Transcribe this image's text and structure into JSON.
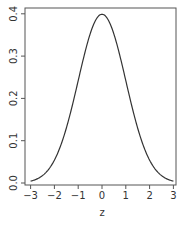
{
  "chart_data": {
    "type": "line",
    "title": "",
    "xlabel": "z",
    "ylabel": "",
    "xlim": [
      -3,
      3
    ],
    "ylim": [
      0,
      0.4
    ],
    "grid": false,
    "legend": null,
    "x_ticks": [
      "-3",
      "-2",
      "-1",
      "0",
      "1",
      "2",
      "3"
    ],
    "y_ticks": [
      "0.0",
      "0.1",
      "0.2",
      "0.3",
      "0.4"
    ],
    "series": [
      {
        "name": "standard normal density",
        "x": [
          -3.0,
          -2.75,
          -2.5,
          -2.25,
          -2.0,
          -1.75,
          -1.5,
          -1.25,
          -1.0,
          -0.75,
          -0.5,
          -0.25,
          0.0,
          0.25,
          0.5,
          0.75,
          1.0,
          1.25,
          1.5,
          1.75,
          2.0,
          2.25,
          2.5,
          2.75,
          3.0
        ],
        "y": [
          0.0044,
          0.0091,
          0.0175,
          0.0317,
          0.054,
          0.0863,
          0.1295,
          0.1826,
          0.242,
          0.3011,
          0.3521,
          0.3867,
          0.3989,
          0.3867,
          0.3521,
          0.3011,
          0.242,
          0.1826,
          0.1295,
          0.0863,
          0.054,
          0.0317,
          0.0175,
          0.0091,
          0.0044
        ]
      }
    ],
    "colors": {
      "line": "#333333",
      "axis": "#555555",
      "text": "#333333"
    }
  }
}
